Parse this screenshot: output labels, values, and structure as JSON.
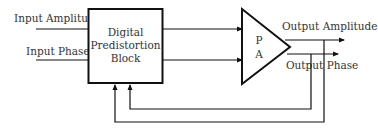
{
  "diagram": {
    "inputs": {
      "amplitude": "Input Amplitude",
      "phase": "Input Phase"
    },
    "dpd_block": {
      "line1": "Digital",
      "line2": "Predistortion",
      "line3": "Block"
    },
    "amplifier": {
      "line1": "P",
      "line2": "A"
    },
    "outputs": {
      "amplitude": "Output Amplitude",
      "phase": "Output Phase"
    },
    "colors": {
      "stroke": "#111111",
      "text": "#333333"
    }
  }
}
